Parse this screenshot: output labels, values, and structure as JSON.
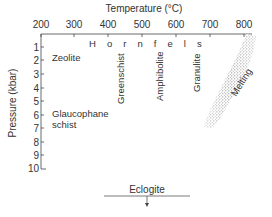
{
  "diagram": {
    "x_axis": {
      "label": "Temperature (°C)",
      "position": "top",
      "ticks": [
        "200",
        "300",
        "400",
        "500",
        "600",
        "700",
        "800"
      ]
    },
    "y_axis": {
      "label": "Pressure (kbar)",
      "position": "left",
      "ticks": [
        "1",
        "2",
        "3",
        "4",
        "5",
        "6",
        "7",
        "8",
        "9",
        "10"
      ]
    },
    "facies": {
      "hornfels": "H o r n f e l s",
      "zeolite": "Zeolite",
      "glaucophane_line1": "Glaucophane",
      "glaucophane_line2": "schist",
      "greenschist": "Greenschist",
      "amphibolite": "Amphibolite",
      "granulite": "Granulite",
      "melting": "Melting",
      "eclogite": "Eclogite"
    },
    "colors": {
      "text": "#333333",
      "axis": "#444444",
      "melting_band": "#9a9a9a"
    }
  }
}
